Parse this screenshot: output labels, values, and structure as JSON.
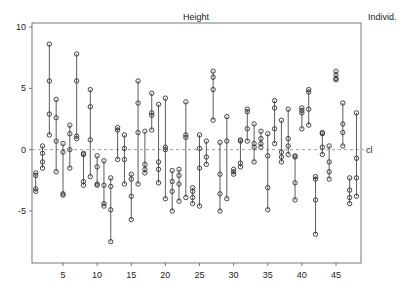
{
  "chart_data": {
    "type": "scatter",
    "title": "Height",
    "right_label": "Individ.",
    "reference_line_label": "cl",
    "xlabel": "",
    "ylabel": "",
    "xlim": [
      0,
      48.5
    ],
    "ylim": [
      -8.9,
      10.5
    ],
    "x_ticks": [
      5,
      10,
      15,
      20,
      25,
      30,
      35,
      40,
      45
    ],
    "y_ticks": [
      -5,
      0,
      5,
      10
    ],
    "reference_line": 0,
    "grid": false,
    "individuals": [
      {
        "x": 1,
        "values": [
          -1.9,
          -2.1,
          -3.2,
          -3.4
        ]
      },
      {
        "x": 2,
        "values": [
          0.3,
          -0.3,
          -1.0,
          -1.5
        ]
      },
      {
        "x": 3,
        "values": [
          8.6,
          5.6,
          2.9,
          1.2
        ]
      },
      {
        "x": 4,
        "values": [
          4.1,
          2.6,
          0.7,
          -1.8
        ]
      },
      {
        "x": 5,
        "values": [
          0.5,
          -0.2,
          -3.6,
          -3.7
        ]
      },
      {
        "x": 6,
        "values": [
          2.0,
          1.3,
          0.0,
          -1.5
        ]
      },
      {
        "x": 7,
        "values": [
          7.8,
          5.6,
          1.1,
          0.9
        ]
      },
      {
        "x": 8,
        "values": [
          -0.3,
          -0.4,
          -2.6,
          -2.9
        ]
      },
      {
        "x": 9,
        "values": [
          4.9,
          3.5,
          0.8,
          -2.2
        ]
      },
      {
        "x": 10,
        "values": [
          -0.5,
          -1.4,
          -2.8,
          -2.9
        ]
      },
      {
        "x": 11,
        "values": [
          -0.9,
          -2.9,
          -4.4,
          -4.6
        ]
      },
      {
        "x": 12,
        "values": [
          -2.3,
          -3.0,
          -4.9,
          -7.5
        ]
      },
      {
        "x": 13,
        "values": [
          1.8,
          1.6,
          -0.8
        ]
      },
      {
        "x": 14,
        "values": [
          1.2,
          0.1,
          -0.8,
          -2.8
        ]
      },
      {
        "x": 15,
        "values": [
          -2.0,
          -2.4,
          -3.8,
          -5.7
        ]
      },
      {
        "x": 16,
        "values": [
          5.6,
          3.8,
          1.4,
          -2.8
        ]
      },
      {
        "x": 17,
        "values": [
          1.5,
          -1.2,
          -1.6,
          -1.9
        ]
      },
      {
        "x": 18,
        "values": [
          4.6,
          3.0,
          2.8,
          1.6
        ]
      },
      {
        "x": 19,
        "values": [
          3.7,
          -1.0,
          -1.6,
          -2.7
        ]
      },
      {
        "x": 20,
        "values": [
          4.2,
          0.2,
          0.0,
          -4.0
        ]
      },
      {
        "x": 21,
        "values": [
          -1.7,
          -2.6,
          -3.4,
          -5.0
        ]
      },
      {
        "x": 22,
        "values": [
          -1.6,
          -2.1,
          -2.8,
          -4.2
        ]
      },
      {
        "x": 23,
        "values": [
          3.9,
          1.2,
          1.0,
          -3.9
        ]
      },
      {
        "x": 24,
        "values": [
          -3.1,
          -3.4,
          -3.9,
          -4.4
        ]
      },
      {
        "x": 25,
        "values": [
          1.2,
          0.1,
          -1.5,
          -4.6
        ]
      },
      {
        "x": 26,
        "values": [
          0.7,
          -0.6,
          -1.2
        ]
      },
      {
        "x": 27,
        "values": [
          6.4,
          5.9,
          4.9,
          2.4
        ]
      },
      {
        "x": 28,
        "values": [
          0.6,
          -2.0,
          -3.6,
          -5.0
        ]
      },
      {
        "x": 29,
        "values": [
          2.7,
          0.7,
          -4.0
        ]
      },
      {
        "x": 30,
        "values": [
          -1.6,
          -1.8,
          -2.0
        ]
      },
      {
        "x": 31,
        "values": [
          0.7,
          0.8,
          -1.1,
          -1.4
        ]
      },
      {
        "x": 32,
        "values": [
          3.3,
          3.1,
          1.7,
          0.7
        ]
      },
      {
        "x": 33,
        "values": [
          2.1,
          0.5,
          0.2,
          -1.0
        ]
      },
      {
        "x": 34,
        "values": [
          1.5,
          0.9,
          0.5,
          0.2
        ]
      },
      {
        "x": 35,
        "values": [
          1.3,
          -0.5,
          -3.1,
          -4.9
        ]
      },
      {
        "x": 36,
        "values": [
          4.0,
          3.4,
          1.7,
          0.5
        ]
      },
      {
        "x": 37,
        "values": [
          2.4,
          -0.2,
          -0.6,
          -1.0
        ]
      },
      {
        "x": 38,
        "values": [
          3.3,
          0.9,
          0.3,
          -0.4
        ]
      },
      {
        "x": 39,
        "values": [
          -0.5,
          -0.6,
          -2.7,
          -4.1
        ]
      },
      {
        "x": 40,
        "values": [
          3.4,
          3.2,
          3.0,
          1.7
        ]
      },
      {
        "x": 41,
        "values": [
          4.9,
          4.7,
          3.3,
          2.0
        ]
      },
      {
        "x": 42,
        "values": [
          -2.2,
          -2.4,
          -4.1,
          -6.9
        ]
      },
      {
        "x": 43,
        "values": [
          1.4,
          1.3,
          0.2,
          -0.4
        ]
      },
      {
        "x": 44,
        "values": [
          0.3,
          -1.0,
          -1.8,
          -2.4
        ]
      },
      {
        "x": 45,
        "values": [
          6.4,
          6.1,
          5.8,
          5.7
        ]
      },
      {
        "x": 46,
        "values": [
          3.8,
          2.1,
          1.4,
          0.3
        ]
      },
      {
        "x": 47,
        "values": [
          -2.3,
          -3.3,
          -3.9,
          -4.4
        ]
      },
      {
        "x": 48,
        "values": [
          3.0,
          -0.7,
          -2.3,
          -3.8
        ]
      }
    ]
  }
}
